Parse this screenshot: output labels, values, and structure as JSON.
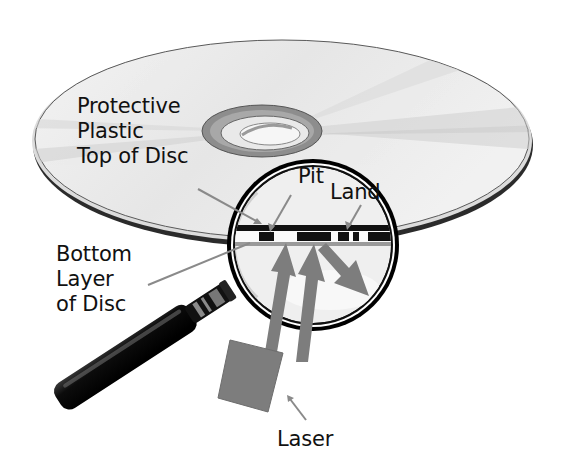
{
  "diagram": {
    "labels": {
      "protective_top": [
        "Protective",
        "Plastic",
        "Top of Disc"
      ],
      "bottom_layer": [
        "Bottom",
        "Layer",
        "of Disc"
      ],
      "pit": "Pit",
      "land": "Land",
      "laser": "Laser"
    },
    "icons": {
      "disc": "cd-disc-icon",
      "magnifier": "magnifying-glass-icon",
      "laser": "laser-emitter-icon"
    },
    "colors": {
      "background": "#ffffff",
      "disc_face": "#ececec",
      "disc_edge": "#2a2a2a",
      "lens_ring": "#111111",
      "laser_gray": "#7d7d7d",
      "leader_line": "#8a8a8a",
      "text": "#111111"
    }
  }
}
